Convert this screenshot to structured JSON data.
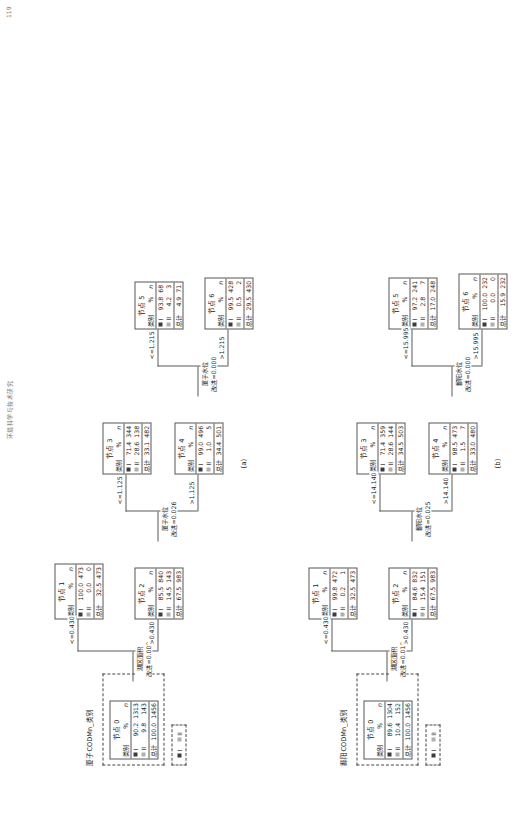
{
  "header": {
    "running_title": "环境科学与技术研究",
    "page_number": "119"
  },
  "legend": {
    "items": [
      "I",
      "II"
    ],
    "swatch_colors": [
      "#3c3c3c",
      "#b0b0b0"
    ]
  },
  "columns": {
    "category": "类别",
    "percent": "%",
    "count": "n",
    "total": "总计"
  },
  "panels": [
    {
      "id": "a",
      "caption": "(a)",
      "root_label": "厦子CODMn_类别",
      "root_title": "节点 0",
      "root_rows": [
        {
          "cat": "I",
          "pct": "90.2",
          "n": "1313"
        },
        {
          "cat": "II",
          "pct": "9.8",
          "n": "143"
        }
      ],
      "root_total": {
        "pct": "100.0",
        "n": "1456"
      },
      "split1": {
        "var": "湖区面积",
        "improve": "改进=0.009"
      },
      "branch1_labels": [
        "<=0.430",
        ">0.430"
      ],
      "nodes_l1": [
        {
          "title": "节点 1",
          "rows": [
            {
              "cat": "I",
              "pct": "100.0",
              "n": "473"
            },
            {
              "cat": "II",
              "pct": "0.0",
              "n": "0"
            }
          ],
          "total": {
            "pct": "32.5",
            "n": "473"
          }
        },
        {
          "title": "节点 2",
          "rows": [
            {
              "cat": "I",
              "pct": "85.5",
              "n": "840"
            },
            {
              "cat": "II",
              "pct": "14.5",
              "n": "143"
            }
          ],
          "total": {
            "pct": "67.5",
            "n": "983"
          }
        }
      ],
      "split2": {
        "var": "厦子水位",
        "improve": "改进=0.026"
      },
      "branch2_labels": [
        "<=1.125",
        ">1.125"
      ],
      "nodes_l2": [
        {
          "title": "节点 3",
          "rows": [
            {
              "cat": "I",
              "pct": "71.4",
              "n": "344"
            },
            {
              "cat": "II",
              "pct": "28.6",
              "n": "138"
            }
          ],
          "total": {
            "pct": "33.1",
            "n": "482"
          }
        },
        {
          "title": "节点 4",
          "rows": [
            {
              "cat": "I",
              "pct": "99.0",
              "n": "496"
            },
            {
              "cat": "II",
              "pct": "1.0",
              "n": "5"
            }
          ],
          "total": {
            "pct": "34.4",
            "n": "501"
          }
        }
      ],
      "split3": {
        "var": "厦子水位",
        "improve": "改进=0.000"
      },
      "branch3_labels": [
        "<=1.215",
        ">1.215"
      ],
      "nodes_l3": [
        {
          "title": "节点 5",
          "rows": [
            {
              "cat": "I",
              "pct": "93.8",
              "n": "68"
            },
            {
              "cat": "II",
              "pct": "4.2",
              "n": "3"
            }
          ],
          "total": {
            "pct": "4.9",
            "n": "71"
          }
        },
        {
          "title": "节点 6",
          "rows": [
            {
              "cat": "I",
              "pct": "99.5",
              "n": "428"
            },
            {
              "cat": "II",
              "pct": "0.5",
              "n": "2"
            }
          ],
          "total": {
            "pct": "29.5",
            "n": "430"
          }
        }
      ]
    },
    {
      "id": "b",
      "caption": "(b)",
      "root_label": "鄱阳CODMn_类别",
      "root_title": "节点 0",
      "root_rows": [
        {
          "cat": "I",
          "pct": "89.6",
          "n": "1304"
        },
        {
          "cat": "II",
          "pct": "10.4",
          "n": "152"
        }
      ],
      "root_total": {
        "pct": "100.0",
        "n": "1456"
      },
      "split1": {
        "var": "湖区面积",
        "improve": "改进=0.010"
      },
      "branch1_labels": [
        "<=0.430",
        ">0.430"
      ],
      "nodes_l1": [
        {
          "title": "节点 1",
          "rows": [
            {
              "cat": "I",
              "pct": "99.8",
              "n": "472"
            },
            {
              "cat": "II",
              "pct": "0.2",
              "n": "1"
            }
          ],
          "total": {
            "pct": "32.5",
            "n": "473"
          }
        },
        {
          "title": "节点 2",
          "rows": [
            {
              "cat": "I",
              "pct": "84.6",
              "n": "832"
            },
            {
              "cat": "II",
              "pct": "15.4",
              "n": "151"
            }
          ],
          "total": {
            "pct": "67.5",
            "n": "983"
          }
        }
      ],
      "split2": {
        "var": "鄱阳水位",
        "improve": "改进=0.025"
      },
      "branch2_labels": [
        "<=14.140",
        ">14.140"
      ],
      "nodes_l2": [
        {
          "title": "节点 3",
          "rows": [
            {
              "cat": "I",
              "pct": "71.4",
              "n": "359"
            },
            {
              "cat": "II",
              "pct": "28.6",
              "n": "144"
            }
          ],
          "total": {
            "pct": "34.5",
            "n": "503"
          }
        },
        {
          "title": "节点 4",
          "rows": [
            {
              "cat": "I",
              "pct": "98.5",
              "n": "473"
            },
            {
              "cat": "II",
              "pct": "1.5",
              "n": "7"
            }
          ],
          "total": {
            "pct": "33.0",
            "n": "480"
          }
        }
      ],
      "split3": {
        "var": "鄱阳水位",
        "improve": "改进=0.000"
      },
      "branch3_labels": [
        "<=15.995",
        ">15.995"
      ],
      "nodes_l3": [
        {
          "title": "节点 5",
          "rows": [
            {
              "cat": "I",
              "pct": "97.2",
              "n": "241"
            },
            {
              "cat": "II",
              "pct": "2.8",
              "n": "7"
            }
          ],
          "total": {
            "pct": "17.0",
            "n": "248"
          }
        },
        {
          "title": "节点 6",
          "rows": [
            {
              "cat": "I",
              "pct": "100.0",
              "n": "232"
            },
            {
              "cat": "II",
              "pct": "0.0",
              "n": "0"
            }
          ],
          "total": {
            "pct": "15.9",
            "n": "232"
          }
        }
      ]
    }
  ]
}
